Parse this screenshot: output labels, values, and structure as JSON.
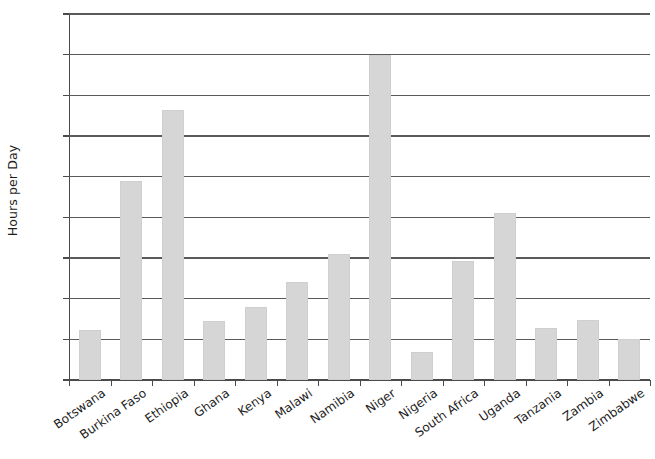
{
  "chart_data": {
    "type": "bar",
    "title": "",
    "subtitle": "",
    "xlabel": "",
    "ylabel": "Hours per Day",
    "ylim": [
      0.0,
      4.5
    ],
    "grid": true,
    "legend": false,
    "legend_position": "none",
    "bar_color": "#d6d6d6",
    "axis_color": "#4b4b4b",
    "ytick_labels": [
      "4.5",
      "4.0",
      "3.5",
      "3.0",
      "2.5",
      "2.0",
      "1.5",
      "1.0",
      "0.5",
      "0.0"
    ],
    "ytick_values": [
      4.5,
      4.0,
      3.5,
      3.0,
      2.5,
      2.0,
      1.5,
      1.0,
      0.5,
      0.0
    ],
    "categories": [
      "Botswana",
      "Burkina Faso",
      "Ethiopia",
      "Ghana",
      "Kenya",
      "Malawi",
      "Namibia",
      "Niger",
      "Nigeria",
      "South Africa",
      "Uganda",
      "Tanzania",
      "Zambia",
      "Zimbabwe"
    ],
    "values": [
      0.61,
      2.45,
      3.32,
      0.73,
      0.9,
      1.21,
      1.55,
      4.0,
      0.35,
      1.46,
      2.05,
      0.64,
      0.74,
      0.51
    ]
  }
}
